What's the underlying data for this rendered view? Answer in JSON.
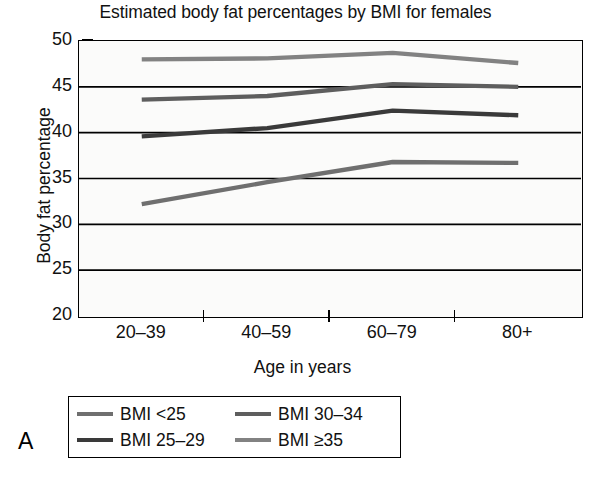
{
  "panel_label": "A",
  "chart_data": {
    "type": "line",
    "title": "Estimated body fat percentages by BMI for females",
    "xlabel": "Age in years",
    "ylabel": "Body fat percentage",
    "categories": [
      "20‒39",
      "40‒59",
      "60‒79",
      "80+"
    ],
    "ylim": [
      20,
      50
    ],
    "yticks": [
      20,
      25,
      30,
      35,
      40,
      45,
      50
    ],
    "ytick_labels": [
      "20",
      "25",
      "30",
      "35",
      "40",
      "45",
      "50"
    ],
    "grid": "horizontal",
    "legend_position": "below-plot",
    "series": [
      {
        "name": "BMI <25",
        "color": "#6f6f6f",
        "values": [
          32.2,
          34.6,
          36.8,
          36.7
        ]
      },
      {
        "name": "BMI 25‒29",
        "color": "#3a3a3a",
        "values": [
          39.6,
          40.5,
          42.4,
          41.9
        ]
      },
      {
        "name": "BMI 30‒34",
        "color": "#5e5e5e",
        "values": [
          43.6,
          44.0,
          45.3,
          45.0
        ]
      },
      {
        "name": "BMI ≥35",
        "color": "#828282",
        "values": [
          48.0,
          48.1,
          48.7,
          47.6
        ]
      }
    ]
  },
  "legend": {
    "items": [
      {
        "label": "BMI <25",
        "color": "#6f6f6f"
      },
      {
        "label": "BMI 30‒34",
        "color": "#5e5e5e"
      },
      {
        "label": "BMI 25‒29",
        "color": "#3a3a3a"
      },
      {
        "label": "BMI ≥35",
        "color": "#828282"
      }
    ]
  }
}
